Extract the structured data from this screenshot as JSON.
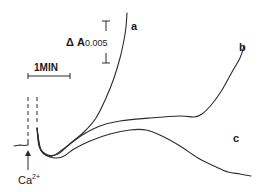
{
  "chart_data": {
    "type": "line",
    "title": "",
    "xlabel": "",
    "ylabel": "",
    "grid": false,
    "legend": "inline curve labels",
    "annotations": {
      "time_scale": {
        "label": "1MIN",
        "x1": 28,
        "x2": 70,
        "y": 74
      },
      "absorbance_scale": {
        "label_prefix": "Δ A",
        "label_value": "0.005",
        "x": 106,
        "y_top": 21,
        "y_bottom": 63
      },
      "addition_marker": {
        "label": "Ca",
        "superscript": "2+",
        "x": 28,
        "arrow_top": 150,
        "arrow_bottom": 170
      }
    },
    "baseline": {
      "points": [
        [
          14,
          146
        ],
        [
          22,
          145
        ],
        [
          28,
          145
        ],
        [
          28,
          143
        ]
      ]
    },
    "dashed_lines": [
      {
        "x": 28,
        "y1": 97,
        "y2": 140
      },
      {
        "x": 37,
        "y1": 97,
        "y2": 140
      }
    ],
    "series": [
      {
        "name": "a",
        "label_pos": [
          131,
          27
        ],
        "points": [
          [
            37,
            128
          ],
          [
            39,
            146
          ],
          [
            44,
            154
          ],
          [
            52,
            156
          ],
          [
            62,
            150
          ],
          [
            72,
            142
          ],
          [
            84,
            132
          ],
          [
            96,
            118
          ],
          [
            106,
            98
          ],
          [
            114,
            78
          ],
          [
            120,
            58
          ],
          [
            124,
            40
          ],
          [
            126,
            27
          ],
          [
            127,
            13
          ]
        ]
      },
      {
        "name": "b",
        "label_pos": [
          241,
          48
        ],
        "points": [
          [
            37,
            128
          ],
          [
            40,
            148
          ],
          [
            48,
            155
          ],
          [
            58,
            154
          ],
          [
            70,
            144
          ],
          [
            84,
            134
          ],
          [
            100,
            126
          ],
          [
            120,
            121
          ],
          [
            150,
            118
          ],
          [
            180,
            116
          ],
          [
            194,
            117
          ],
          [
            202,
            114
          ],
          [
            212,
            104
          ],
          [
            222,
            90
          ],
          [
            232,
            72
          ],
          [
            240,
            58
          ],
          [
            244,
            46
          ]
        ]
      },
      {
        "name": "c",
        "label_pos": [
          234,
          140
        ],
        "points": [
          [
            37,
            128
          ],
          [
            41,
            150
          ],
          [
            50,
            157
          ],
          [
            62,
            157
          ],
          [
            74,
            149
          ],
          [
            90,
            141
          ],
          [
            110,
            134
          ],
          [
            130,
            130
          ],
          [
            146,
            130
          ],
          [
            162,
            136
          ],
          [
            180,
            146
          ],
          [
            198,
            158
          ],
          [
            214,
            166
          ],
          [
            228,
            172
          ],
          [
            240,
            174
          ],
          [
            251,
            176
          ]
        ]
      }
    ]
  },
  "labels": {
    "time_scale": "1MIN",
    "delta_a": "Δ A",
    "delta_a_value": "0.005",
    "trace_a": "a",
    "trace_b": "b",
    "trace_c": "c",
    "ion": "Ca",
    "ion_charge": "2+"
  }
}
